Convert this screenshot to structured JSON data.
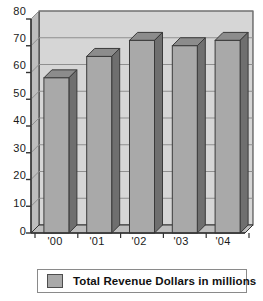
{
  "chart_data": {
    "type": "bar",
    "title": "",
    "subtitle": "",
    "xlabel": "",
    "ylabel": "",
    "categories": [
      "'00",
      "'01",
      "'02",
      "'03",
      "'04"
    ],
    "values": [
      58,
      66,
      72,
      70,
      72
    ],
    "series": [
      {
        "name": "Total Revenue Dollars in millions",
        "values": [
          58,
          66,
          72,
          70,
          72
        ],
        "color": "#a9a9a9"
      }
    ],
    "ylim": [
      0,
      80
    ],
    "yticks": [
      0,
      10,
      20,
      30,
      40,
      50,
      60,
      70,
      80
    ],
    "ytick_labels": [
      "0",
      "10",
      "20",
      "30",
      "40",
      "50",
      "60",
      "70",
      "80"
    ],
    "grid": true,
    "grid_axis": "y",
    "legend_position": "bottom",
    "style": "3d-column",
    "colors": {
      "bar_front": "#a9a9a9",
      "bar_side": "#6f6f6f",
      "bar_top": "#8c8c8c",
      "plot_background": "#d6d6d6",
      "plot_floor": "#bdbdbd",
      "gridline": "#8f8f8f",
      "axis": "#333333",
      "text": "#1a1a1a",
      "legend_border": "#8a8a8a"
    }
  },
  "legend": {
    "entries": [
      {
        "label": "Total Revenue Dollars in millions",
        "swatch_color": "#a9a9a9"
      }
    ]
  },
  "axes": {
    "y": {
      "ticks": [
        "80",
        "70",
        "60",
        "50",
        "40",
        "30",
        "20",
        "10",
        "0"
      ]
    },
    "x": {
      "ticks": [
        "'00",
        "'01",
        "'02",
        "'03",
        "'04"
      ]
    }
  }
}
